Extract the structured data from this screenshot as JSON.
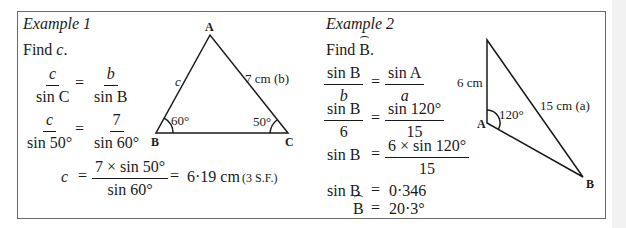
{
  "example1": {
    "title": "Example 1",
    "prompt_prefix": "Find ",
    "prompt_var": "c",
    "prompt_suffix": ".",
    "eq1": {
      "lhs_num": "c",
      "lhs_den": "sin C",
      "rhs_num": "b",
      "rhs_den": "sin B"
    },
    "eq2": {
      "lhs_num": "c",
      "lhs_den": "sin 50°",
      "rhs_num": "7",
      "rhs_den": "sin 60°"
    },
    "eq3": {
      "lhs": "c",
      "num": "7 × sin 50°",
      "den": "sin 60°",
      "result": "6·19 cm",
      "note": "(3 S.F.)"
    },
    "triangle": {
      "vertex_a": "A",
      "vertex_b": "B",
      "vertex_c": "C",
      "side_c": "c",
      "side_b": "7 cm (b)",
      "angle_b": "60°",
      "angle_c": "50°"
    }
  },
  "example2": {
    "title": "Example 2",
    "prompt_prefix": "Find ",
    "prompt_var": "B",
    "prompt_suffix": ".",
    "eq1": {
      "lhs_num": "sin B",
      "lhs_den": "b",
      "rhs_num": "sin A",
      "rhs_den": "a"
    },
    "eq2": {
      "lhs_num": "sin B",
      "lhs_den": "6",
      "rhs_num": "sin 120°",
      "rhs_den": "15"
    },
    "eq3": {
      "lhs": "sin B",
      "num": "6 × sin 120°",
      "den": "15"
    },
    "eq4": {
      "lhs": "sin B",
      "rhs": "0·346"
    },
    "eq5": {
      "lhs": "B",
      "rhs": "20·3°"
    },
    "triangle": {
      "vertex_a": "A",
      "vertex_b": "B",
      "side_left": "6 cm",
      "side_a": "15 cm (a)",
      "angle_a": "120°"
    }
  },
  "symbols": {
    "equals": "="
  }
}
